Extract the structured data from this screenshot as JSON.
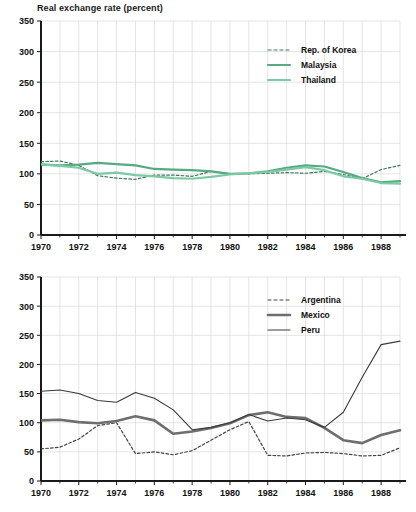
{
  "figure": {
    "title": "Real exchange rate (percent)",
    "background": "#ffffff",
    "axis_color": "#1a1a1a",
    "grid_color": "#d9d9d9"
  },
  "chart_data": [
    {
      "id": "asia",
      "type": "line",
      "title": "Real exchange rate (percent)",
      "xlabel": "",
      "ylabel": "",
      "xlim": [
        1970,
        1989
      ],
      "ylim": [
        0,
        350
      ],
      "yticks": [
        0,
        50,
        100,
        150,
        200,
        250,
        300,
        350
      ],
      "xticks": [
        1970,
        1972,
        1974,
        1976,
        1978,
        1980,
        1982,
        1984,
        1986,
        1988
      ],
      "grid": true,
      "minor_grid_years": [
        1971,
        1973,
        1975,
        1977,
        1979,
        1981,
        1983,
        1985,
        1987,
        1989
      ],
      "legend_position": "top-right",
      "x": [
        1970,
        1971,
        1972,
        1973,
        1974,
        1975,
        1976,
        1977,
        1978,
        1979,
        1980,
        1981,
        1982,
        1983,
        1984,
        1985,
        1986,
        1987,
        1988,
        1989
      ],
      "series": [
        {
          "name": "Rep. of Korea",
          "style": "dashed",
          "color": "#3f7a5e",
          "values": [
            120,
            121,
            114,
            97,
            93,
            91,
            98,
            98,
            96,
            104,
            100,
            100,
            101,
            102,
            101,
            104,
            99,
            92,
            107,
            114
          ]
        },
        {
          "name": "Malaysia",
          "style": "solid",
          "color": "#57a982",
          "values": [
            115,
            114,
            115,
            118,
            116,
            114,
            108,
            107,
            106,
            104,
            100,
            101,
            104,
            110,
            114,
            112,
            103,
            93,
            86,
            88
          ]
        },
        {
          "name": "Thailand",
          "style": "solid",
          "color": "#7ec9a5",
          "values": [
            116,
            113,
            110,
            100,
            102,
            98,
            96,
            93,
            92,
            95,
            99,
            101,
            103,
            107,
            111,
            106,
            96,
            92,
            85,
            84
          ]
        }
      ]
    },
    {
      "id": "latam",
      "type": "line",
      "title": "",
      "xlabel": "",
      "ylabel": "",
      "xlim": [
        1970,
        1989
      ],
      "ylim": [
        0,
        350
      ],
      "yticks": [
        0,
        50,
        100,
        150,
        200,
        250,
        300,
        350
      ],
      "xticks": [
        1970,
        1972,
        1974,
        1976,
        1978,
        1980,
        1982,
        1984,
        1986,
        1988
      ],
      "grid": true,
      "minor_grid_years": [
        1971,
        1973,
        1975,
        1977,
        1979,
        1981,
        1983,
        1985,
        1987,
        1989
      ],
      "legend_position": "top-right",
      "x": [
        1970,
        1971,
        1972,
        1973,
        1974,
        1975,
        1976,
        1977,
        1978,
        1979,
        1980,
        1981,
        1982,
        1983,
        1984,
        1985,
        1986,
        1987,
        1988,
        1989
      ],
      "series": [
        {
          "name": "Argentina",
          "style": "dashed",
          "color": "#444444",
          "values": [
            55,
            58,
            72,
            95,
            100,
            47,
            50,
            45,
            52,
            70,
            88,
            102,
            44,
            43,
            48,
            49,
            47,
            43,
            44,
            57
          ]
        },
        {
          "name": "Mexico",
          "style": "solid-thick",
          "color": "#6e6e6e",
          "values": [
            104,
            105,
            101,
            99,
            103,
            111,
            104,
            81,
            85,
            91,
            99,
            113,
            118,
            110,
            108,
            91,
            70,
            65,
            79,
            87
          ]
        },
        {
          "name": "Peru",
          "style": "solid-thin",
          "color": "#3a3a3a",
          "values": [
            154,
            156,
            150,
            138,
            135,
            152,
            142,
            122,
            88,
            92,
            100,
            114,
            103,
            108,
            105,
            92,
            118,
            178,
            234,
            240
          ]
        }
      ]
    }
  ],
  "legends": {
    "top": [
      {
        "label": "Rep. of Korea",
        "swatch": "dashed-green-dark"
      },
      {
        "label": "Malaysia",
        "swatch": "solid-green-mid"
      },
      {
        "label": "Thailand",
        "swatch": "solid-green-light"
      }
    ],
    "bottom": [
      {
        "label": "Argentina",
        "swatch": "dashed-gray-dark"
      },
      {
        "label": "Mexico",
        "swatch": "solid-gray-thick"
      },
      {
        "label": "Peru",
        "swatch": "solid-gray-thin"
      }
    ]
  },
  "axes": {
    "y_tick_labels": [
      "350",
      "300",
      "250",
      "200",
      "150",
      "100",
      "50",
      "0"
    ],
    "x_tick_labels": [
      "1970",
      "1972",
      "1974",
      "1976",
      "1978",
      "1980",
      "1982",
      "1984",
      "1986",
      "1988"
    ]
  }
}
